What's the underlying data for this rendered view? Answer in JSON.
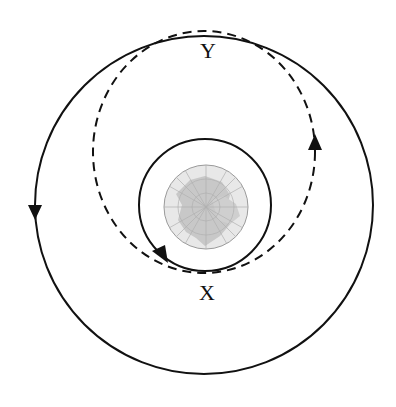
{
  "diagram": {
    "labels": {
      "point_y": "Y",
      "point_x": "X"
    },
    "elements": {
      "earth": {
        "description": "Earth (globe, polar view)",
        "fill": "#d6d6d6",
        "stroke": "#999999"
      },
      "inner_orbit": {
        "type": "circle",
        "style": "solid",
        "direction": "counterclockwise"
      },
      "outer_orbit": {
        "type": "circle",
        "style": "solid",
        "direction": "counterclockwise"
      },
      "transfer_orbit": {
        "type": "ellipse",
        "style": "dashed",
        "perigee": "X",
        "apogee": "Y"
      }
    },
    "colors": {
      "line": "#111111",
      "earth_land": "#c9c9c9",
      "earth_ocean": "#e6e6e6"
    }
  }
}
